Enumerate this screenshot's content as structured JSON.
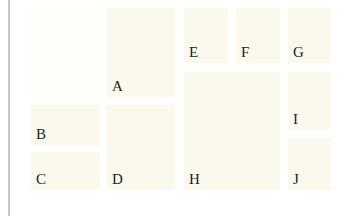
{
  "diagram": {
    "type": "labeled-grid",
    "colors": {
      "background": "#ffffff",
      "box_fill": "#fbf9ee",
      "box_fill_faint": "#fefdf8",
      "left_rule": "#c8c8c8",
      "label": "#222222"
    },
    "boxes": [
      {
        "id": "blank",
        "label": ""
      },
      {
        "id": "A",
        "label": "A"
      },
      {
        "id": "B",
        "label": "B"
      },
      {
        "id": "C",
        "label": "C"
      },
      {
        "id": "D",
        "label": "D"
      },
      {
        "id": "E",
        "label": "E"
      },
      {
        "id": "F",
        "label": "F"
      },
      {
        "id": "G",
        "label": "G"
      },
      {
        "id": "H",
        "label": "H"
      },
      {
        "id": "I",
        "label": "I"
      },
      {
        "id": "J",
        "label": "J"
      }
    ]
  }
}
